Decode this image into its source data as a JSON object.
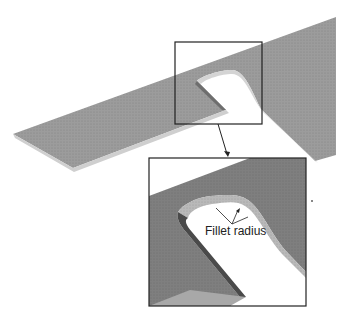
{
  "figure": {
    "callout_label": "Fillet radius",
    "colors": {
      "plate_top": "#9a9a9a",
      "plate_edge": "#c8c8c8",
      "inset_plate": "#7d7d7d",
      "inset_fillet": "#b5b5b5",
      "frame": "#222222",
      "background": "#ffffff"
    }
  }
}
